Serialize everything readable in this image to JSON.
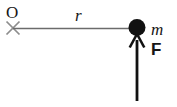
{
  "figure": {
    "kind": "physics-free-body-diagram",
    "width": 177,
    "height": 107,
    "background_color": "#ffffff"
  },
  "labels": {
    "origin": "O",
    "radius": "r",
    "mass": "m",
    "force": "F"
  },
  "elements": {
    "pivot_marker": {
      "name": "x-mark-icon",
      "center_x": 13,
      "center_y": 28,
      "arm": 7,
      "color": "#8d8d8d",
      "stroke_width": 1.6
    },
    "rod": {
      "name": "rod-line",
      "x1": 14,
      "y1": 28.5,
      "x2": 136,
      "y2": 28.5,
      "color": "#6b6b6b",
      "stroke_width": 1.6
    },
    "mass_dot": {
      "name": "mass-point",
      "cx": 137,
      "cy": 28,
      "r": 8.5,
      "color": "#111111"
    },
    "force_arrow": {
      "name": "force-arrow",
      "x": 137,
      "tail_y": 101,
      "tip_y": 34,
      "head_half_width": 7,
      "head_length": 12,
      "color": "#111111",
      "shaft_width": 2.6,
      "direction": "up"
    }
  },
  "colors": {
    "ink": "#111111",
    "rod_gray": "#6b6b6b",
    "pivot_gray": "#8d8d8d",
    "paper": "#ffffff"
  }
}
